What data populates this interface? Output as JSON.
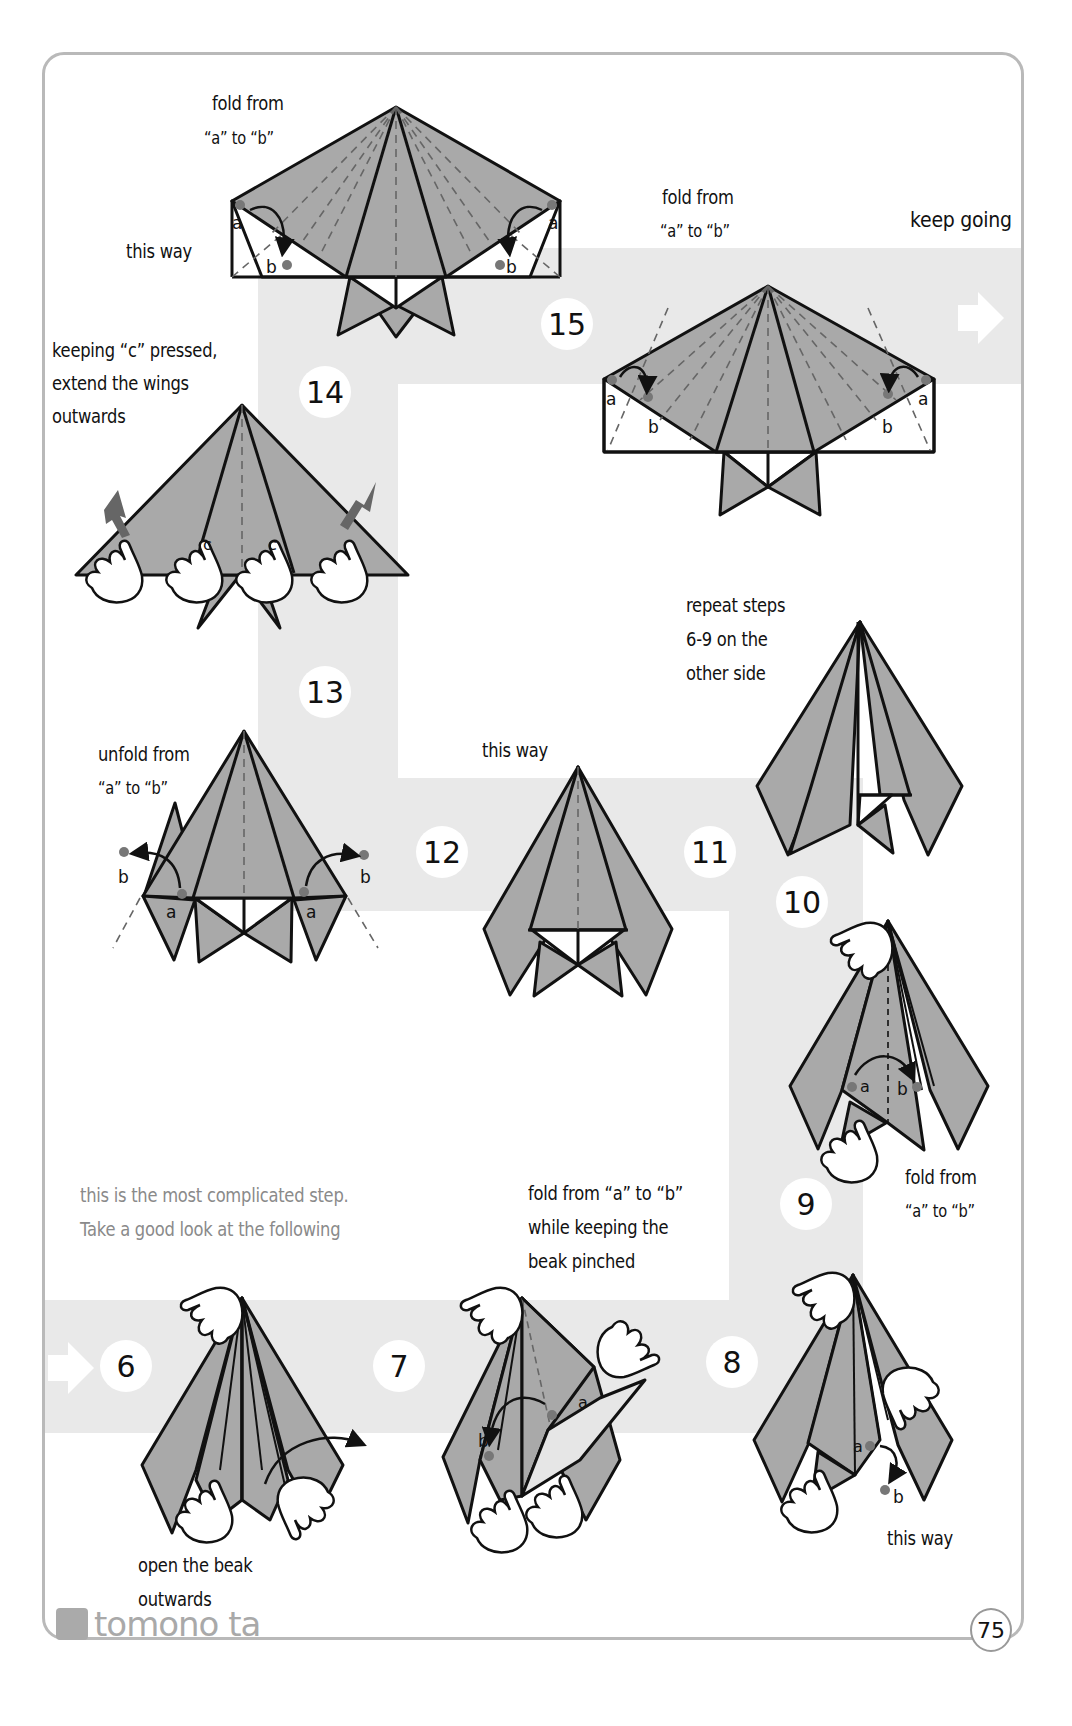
{
  "page": {
    "number": "75",
    "brand": "tomono ta",
    "colors": {
      "paper_fill": "#a9a9a9",
      "path_band": "#e9e9e9",
      "outline": "#111111",
      "dot": "#777777",
      "wing_arrow": "#666666",
      "frame": "#b9b9b9",
      "note_gray": "#8a8a8a"
    }
  },
  "top": {
    "keep_going": "keep going"
  },
  "steps": [
    {
      "id": "step-15-top",
      "number": "",
      "labels": {
        "instruction_1": "fold from",
        "instruction_2": "“a” to “b”",
        "side": "this way"
      },
      "points": [
        "a",
        "b",
        "a",
        "b"
      ]
    },
    {
      "id": "step-15",
      "number": "15",
      "labels": {
        "instruction_1": "fold from",
        "instruction_2": "“a” to “b”"
      },
      "points": [
        "a",
        "b",
        "a",
        "b"
      ]
    },
    {
      "id": "step-14",
      "number": "14",
      "labels": {
        "line_1": "keeping “c” pressed,",
        "line_2": "extend the wings",
        "line_3": "outwards"
      },
      "points": [
        "c",
        "c"
      ]
    },
    {
      "id": "step-13",
      "number": "13",
      "labels": {
        "line_1": "unfold from",
        "line_2": "“a” to “b”"
      },
      "points": [
        "b",
        "a",
        "a",
        "b"
      ]
    },
    {
      "id": "step-12",
      "number": "12",
      "labels": {
        "line_1": "this way"
      }
    },
    {
      "id": "step-11",
      "number": "11",
      "labels": {
        "line_1": "repeat steps",
        "line_2": "6-9 on the",
        "line_3": "other side"
      }
    },
    {
      "id": "step-10",
      "number": "10",
      "labels": {
        "line_1": "fold from",
        "line_2": "“a” to “b”"
      },
      "points": [
        "a",
        "b"
      ]
    },
    {
      "id": "step-9",
      "number": "9",
      "labels": {
        "line_1": "this way"
      },
      "points": [
        "a",
        "b"
      ]
    },
    {
      "id": "step-8",
      "number": "8",
      "labels": {
        "line_1": "fold from “a” to “b”",
        "line_2": "while keeping the",
        "line_3": "beak pinched"
      },
      "points": [
        "a",
        "b"
      ]
    },
    {
      "id": "step-7",
      "number": "7"
    },
    {
      "id": "step-6",
      "number": "6",
      "labels": {
        "line_1": "open the beak",
        "line_2": "outwards"
      }
    }
  ],
  "notes": {
    "complicated_1": "this is the most complicated step.",
    "complicated_2": "Take a good look at the following"
  }
}
